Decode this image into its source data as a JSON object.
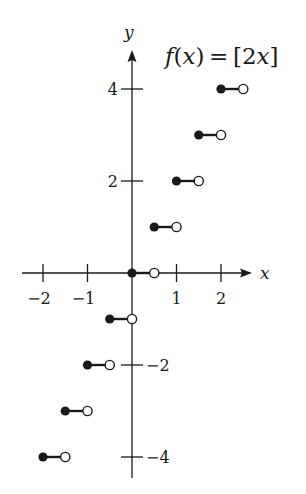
{
  "chart_data": {
    "type": "scatter",
    "xlabel": "x",
    "ylabel": "y",
    "xlim": [
      -2.5,
      2.7
    ],
    "ylim": [
      -4.5,
      4.9
    ],
    "x_ticks": [
      -2,
      -1,
      1,
      2
    ],
    "x_tick_labels": [
      "−2",
      "−1",
      "1",
      "2"
    ],
    "y_ticks": [
      4,
      2,
      -2,
      -4
    ],
    "y_tick_labels": [
      "4",
      "2",
      "−2",
      "−4"
    ],
    "grid": false,
    "legend": "none",
    "segments": [
      {
        "x_start": -2.0,
        "x_end": -1.5,
        "y": -4
      },
      {
        "x_start": -1.5,
        "x_end": -1.0,
        "y": -3
      },
      {
        "x_start": -1.0,
        "x_end": -0.5,
        "y": -2
      },
      {
        "x_start": -0.5,
        "x_end": 0.0,
        "y": -1
      },
      {
        "x_start": 0.0,
        "x_end": 0.5,
        "y": 0
      },
      {
        "x_start": 0.5,
        "x_end": 1.0,
        "y": 1
      },
      {
        "x_start": 1.0,
        "x_end": 1.5,
        "y": 2
      },
      {
        "x_start": 1.5,
        "x_end": 2.0,
        "y": 3
      },
      {
        "x_start": 2.0,
        "x_end": 2.5,
        "y": 4
      }
    ]
  },
  "labels": {
    "x_axis": "x",
    "y_axis": "y"
  },
  "colors": {
    "ink": "#1a1a1a",
    "background": "#ffffff"
  }
}
